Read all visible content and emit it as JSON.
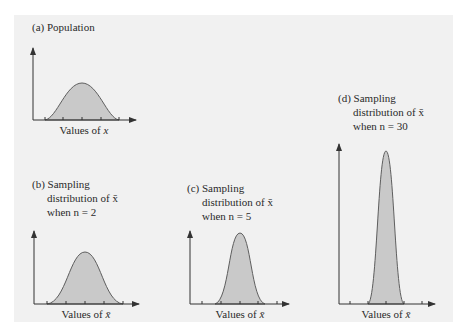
{
  "figure": {
    "panels": [
      {
        "id": "a",
        "title_line1": "(a) Population",
        "axis_label_prefix": "Values of ",
        "axis_var": "x"
      },
      {
        "id": "b",
        "title_line1": "(b) Sampling",
        "title_line2": "distribution of x̄",
        "title_line3": "when n = 2",
        "axis_label_prefix": "Values of ",
        "axis_var": "x̄"
      },
      {
        "id": "c",
        "title_line1": "(c) Sampling",
        "title_line2": "distribution of x̄",
        "title_line3": "when n = 5",
        "axis_label_prefix": "Values of ",
        "axis_var": "x̄"
      },
      {
        "id": "d",
        "title_line1": "(d) Sampling",
        "title_line2": "distribution of x̄",
        "title_line3": "when n = 30",
        "axis_label_prefix": "Values of ",
        "axis_var": "x̄"
      }
    ],
    "colors": {
      "panel_background": "#f1f1f1",
      "curve_fill": "#c9c9c9",
      "curve_stroke": "#5e5e5e",
      "axis": "#333333"
    }
  }
}
